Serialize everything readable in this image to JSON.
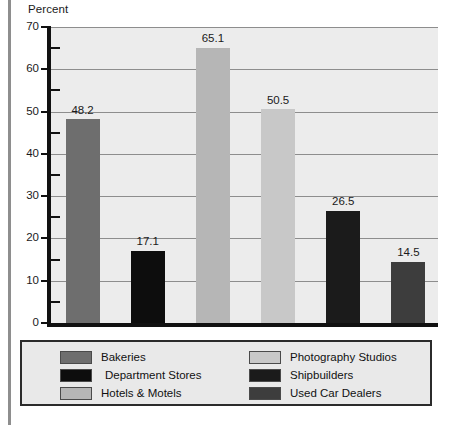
{
  "axis_caption": "Percent",
  "colors": {
    "bakeries": "#6e6e6e",
    "department_stores": "#0d0d0d",
    "hotels_motels": "#b6b6b6",
    "photography_studios": "#c8c8c8",
    "shipbuilders": "#1b1b1b",
    "used_car_dealers": "#3d3d3d",
    "plot_background": "#ececec",
    "gridline": "#8d8d8d",
    "axis": "#111111",
    "legend_background": "#e9e9e9",
    "legend_border": "#2b2b2b"
  },
  "legend": {
    "left_column": [
      {
        "label": "Bakeries",
        "color_key": "bakeries",
        "indent": false
      },
      {
        "label": "Department Stores",
        "color_key": "department_stores",
        "indent": true
      },
      {
        "label": "Hotels & Motels",
        "color_key": "hotels_motels",
        "indent": false
      }
    ],
    "right_column": [
      {
        "label": "Photography Studios",
        "color_key": "photography_studios",
        "indent": false
      },
      {
        "label": "Shipbuilders",
        "color_key": "shipbuilders",
        "indent": false
      },
      {
        "label": "Used Car Dealers",
        "color_key": "used_car_dealers",
        "indent": false
      }
    ]
  },
  "chart_data": {
    "type": "bar",
    "title": "",
    "xlabel": "",
    "ylabel": "Percent",
    "ylim": [
      0,
      70
    ],
    "y_major_ticks": [
      0,
      10,
      20,
      30,
      40,
      50,
      60,
      70
    ],
    "y_minor_ticks": [
      5,
      15,
      25,
      35,
      45,
      55,
      65
    ],
    "y_tick_labels": [
      "0",
      "10",
      "20",
      "30",
      "40",
      "50",
      "60",
      "70"
    ],
    "grid": true,
    "grid_axis": "y",
    "legend_position": "below",
    "show_value_labels": true,
    "categories": [
      "Bakeries",
      "Department Stores",
      "Hotels & Motels",
      "Photography Studios",
      "Shipbuilders",
      "Used Car Dealers"
    ],
    "values": [
      48.2,
      17.1,
      65.1,
      50.5,
      26.5,
      14.5
    ],
    "value_labels": [
      "48.2",
      "17.1",
      "65.1",
      "50.5",
      "26.5",
      "14.5"
    ],
    "bar_colors": [
      "#6e6e6e",
      "#0d0d0d",
      "#b6b6b6",
      "#c8c8c8",
      "#1b1b1b",
      "#3d3d3d"
    ]
  }
}
